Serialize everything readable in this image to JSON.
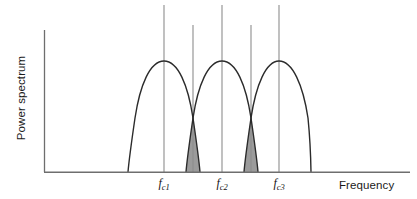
{
  "figure": {
    "axis_labels": {
      "y": "Power spectrum",
      "x": "Frequency"
    },
    "tick_labels": [
      {
        "base": "f",
        "sub": "c1",
        "x": 164
      },
      {
        "base": "f",
        "sub": "c2",
        "x": 222
      },
      {
        "base": "f",
        "sub": "c3",
        "x": 279
      }
    ],
    "colors": {
      "curve": "#2b2b2b",
      "axis": "#6e6e6e",
      "marker_line": "#8a8a8a",
      "shaded_region": "#9a9a9a",
      "background": "#ffffff"
    }
  },
  "chart_data": {
    "type": "line",
    "title": "",
    "xlabel": "Frequency",
    "ylabel": "Power spectrum",
    "grid": false,
    "legend": "none",
    "axis_origin": {
      "x": 44,
      "y": 172
    },
    "axis_x_end": 410,
    "axis_y_top": 30,
    "xlim": [
      44,
      410
    ],
    "ylim": [
      172,
      30
    ],
    "carrier_frequencies": [
      {
        "label": "fc1",
        "x": 164,
        "value": 1
      },
      {
        "label": "fc2",
        "x": 222,
        "value": 2
      },
      {
        "label": "fc3",
        "x": 279,
        "value": 3
      }
    ],
    "crossing_points": [
      {
        "x": 193,
        "y": 118
      },
      {
        "x": 251,
        "y": 118
      }
    ],
    "series": [
      {
        "name": "channel-1-lobe",
        "peak_x": 164,
        "peak_y": 61,
        "left_x": 128,
        "right_x": 200
      },
      {
        "name": "channel-2-lobe",
        "peak_x": 222,
        "peak_y": 61,
        "left_x": 186,
        "right_x": 258
      },
      {
        "name": "channel-3-lobe",
        "peak_x": 279,
        "peak_y": 61,
        "left_x": 244,
        "right_x": 311
      }
    ],
    "shaded_overlap_regions": [
      {
        "name": "overlap-1",
        "x_center": 193,
        "x_left": 186,
        "x_right": 200,
        "top_y": 118,
        "bottom_y": 172
      },
      {
        "name": "overlap-2",
        "x_center": 251,
        "x_left": 244,
        "x_right": 258,
        "top_y": 118,
        "bottom_y": 172
      }
    ],
    "marker_lines": [
      {
        "name": "fc1-line",
        "x": 164,
        "top_y": 5,
        "bottom_y": 172
      },
      {
        "name": "crossing-1-line",
        "x": 193,
        "top_y": 25,
        "bottom_y": 172
      },
      {
        "name": "fc2-line",
        "x": 222,
        "top_y": 5,
        "bottom_y": 172
      },
      {
        "name": "crossing-2-line",
        "x": 251,
        "top_y": 25,
        "bottom_y": 172
      },
      {
        "name": "fc3-line",
        "x": 279,
        "top_y": 5,
        "bottom_y": 172
      }
    ]
  }
}
